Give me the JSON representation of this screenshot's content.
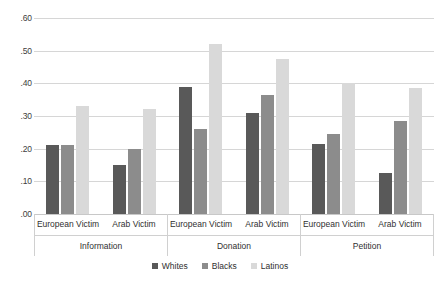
{
  "chart_data": {
    "type": "bar",
    "title": "",
    "subtitle": "",
    "xlabel": "",
    "ylabel": "",
    "ylim": [
      0.0,
      0.6
    ],
    "ytick_labels": [
      ".60",
      ".50",
      ".40",
      ".30",
      ".20",
      ".10",
      ".00"
    ],
    "ytick_values": [
      0.6,
      0.5,
      0.4,
      0.3,
      0.2,
      0.1,
      0.0
    ],
    "grid": true,
    "legend_position": "bottom-center",
    "legend": [
      "Whites",
      "Blacks",
      "Latinos"
    ],
    "series": [
      {
        "name": "Whites",
        "color": "#595959",
        "values": [
          0.21,
          0.15,
          0.39,
          0.31,
          0.215,
          0.125
        ]
      },
      {
        "name": "Blacks",
        "color": "#8c8c8c",
        "values": [
          0.21,
          0.2,
          0.26,
          0.365,
          0.245,
          0.285
        ]
      },
      {
        "name": "Latinos",
        "color": "#d9d9d9",
        "values": [
          0.33,
          0.32,
          0.52,
          0.475,
          0.4,
          0.385
        ]
      }
    ],
    "categories": [
      "European Victim",
      "Arab Victim",
      "European Victim",
      "Arab Victim",
      "European Victim",
      "Arab Victim"
    ],
    "outer_categories": [
      "Information",
      "Donation",
      "Petition"
    ],
    "groups": [
      {
        "label": "Information",
        "subgroups": [
          {
            "label": "European Victim",
            "bars": [
              {
                "series": "Whites",
                "value": 0.21,
                "color": "#595959"
              },
              {
                "series": "Blacks",
                "value": 0.21,
                "color": "#8c8c8c"
              },
              {
                "series": "Latinos",
                "value": 0.33,
                "color": "#d9d9d9"
              }
            ]
          },
          {
            "label": "Arab Victim",
            "bars": [
              {
                "series": "Whites",
                "value": 0.15,
                "color": "#595959"
              },
              {
                "series": "Blacks",
                "value": 0.2,
                "color": "#8c8c8c"
              },
              {
                "series": "Latinos",
                "value": 0.32,
                "color": "#d9d9d9"
              }
            ]
          }
        ]
      },
      {
        "label": "Donation",
        "subgroups": [
          {
            "label": "European Victim",
            "bars": [
              {
                "series": "Whites",
                "value": 0.39,
                "color": "#595959"
              },
              {
                "series": "Blacks",
                "value": 0.26,
                "color": "#8c8c8c"
              },
              {
                "series": "Latinos",
                "value": 0.52,
                "color": "#d9d9d9"
              }
            ]
          },
          {
            "label": "Arab Victim",
            "bars": [
              {
                "series": "Whites",
                "value": 0.31,
                "color": "#595959"
              },
              {
                "series": "Blacks",
                "value": 0.365,
                "color": "#8c8c8c"
              },
              {
                "series": "Latinos",
                "value": 0.475,
                "color": "#d9d9d9"
              }
            ]
          }
        ]
      },
      {
        "label": "Petition",
        "subgroups": [
          {
            "label": "European Victim",
            "bars": [
              {
                "series": "Whites",
                "value": 0.215,
                "color": "#595959"
              },
              {
                "series": "Blacks",
                "value": 0.245,
                "color": "#8c8c8c"
              },
              {
                "series": "Latinos",
                "value": 0.4,
                "color": "#d9d9d9"
              }
            ]
          },
          {
            "label": "Arab Victim",
            "bars": [
              {
                "series": "Whites",
                "value": 0.125,
                "color": "#595959"
              },
              {
                "series": "Blacks",
                "value": 0.285,
                "color": "#8c8c8c"
              },
              {
                "series": "Latinos",
                "value": 0.385,
                "color": "#d9d9d9"
              }
            ]
          }
        ]
      }
    ]
  }
}
